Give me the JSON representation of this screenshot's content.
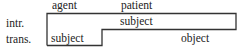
{
  "diagram": {
    "column_headers": {
      "agent": "agent",
      "patient": "patient"
    },
    "row_labels": {
      "intransitive": "intr.",
      "transitive": "trans."
    },
    "intransitive_row": {
      "subject": "subject"
    },
    "transitive_row": {
      "subject": "subject",
      "object": "object"
    },
    "line_color": "#333333"
  }
}
